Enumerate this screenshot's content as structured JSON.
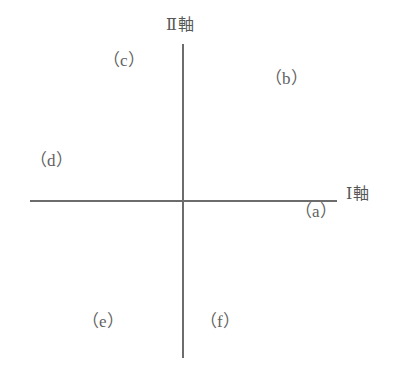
{
  "diagram": {
    "kind": "coordinate-plane",
    "background_color": "#ffffff",
    "line_color": "#6c6c6c",
    "text_color": "#5f5f5f",
    "axes": {
      "horizontal": {
        "label": "Ⅰ軸",
        "label_meaning": "Axis I"
      },
      "vertical": {
        "label": "Ⅱ軸",
        "label_meaning": "Axis II"
      }
    },
    "region_labels": [
      {
        "key": "a",
        "text": "（a）",
        "position": "below-horizontal-axis-right"
      },
      {
        "key": "b",
        "text": "（b）",
        "position": "upper-right-quadrant"
      },
      {
        "key": "c",
        "text": "（c）",
        "position": "upper-left-quadrant"
      },
      {
        "key": "d",
        "text": "（d）",
        "position": "left-of-origin-above-axis"
      },
      {
        "key": "e",
        "text": "（e）",
        "position": "lower-left-quadrant"
      },
      {
        "key": "f",
        "text": "（f）",
        "position": "lower-right-quadrant"
      }
    ]
  },
  "chart_data": {
    "type": "scatter",
    "title": "",
    "xlabel": "Ⅰ軸",
    "ylabel": "Ⅱ軸",
    "grid": false,
    "legend": null,
    "series": [],
    "annotations": [
      {
        "label": "（c）",
        "quadrant": 2,
        "x": -0.45,
        "y": 0.72
      },
      {
        "label": "（b）",
        "quadrant": 1,
        "x": 0.55,
        "y": 0.6
      },
      {
        "label": "（d）",
        "quadrant": 2,
        "x": -0.95,
        "y": 0.26
      },
      {
        "label": "（a）",
        "quadrant": 4,
        "x": 0.75,
        "y": -0.04
      },
      {
        "label": "（e）",
        "quadrant": 3,
        "x": -0.62,
        "y": -0.67
      },
      {
        "label": "（f）",
        "quadrant": 4,
        "x": 0.12,
        "y": -0.67
      }
    ],
    "xlim": [
      -1,
      1
    ],
    "ylim": [
      -1,
      1
    ]
  }
}
